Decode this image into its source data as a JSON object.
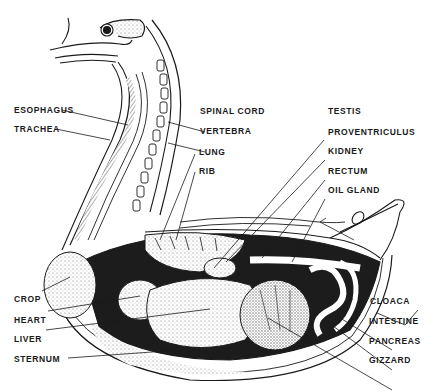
{
  "diagram": {
    "colors": {
      "ink": "#1a1a1a",
      "background": "#ffffff",
      "stipple": "#9a9a9a",
      "dark_fill": "#1c1c1c"
    },
    "labels": {
      "esophagus": "ESOPHAGUS",
      "trachea": "TRACHEA",
      "spinal_cord": "SPINAL CORD",
      "vertebra": "VERTEBRA",
      "lung": "LUNG",
      "rib": "RIB",
      "testis": "TESTIS",
      "proventriculus": "PROVENTRICULUS",
      "kidney": "KIDNEY",
      "rectum": "RECTUM",
      "oil_gland": "OIL GLAND",
      "crop": "CROP",
      "heart": "HEART",
      "liver": "LIVER",
      "sternum": "STERNUM",
      "cloaca": "CLOACA",
      "intestine": "INTESTINE",
      "pancreas": "PANCREAS",
      "gizzard": "GIZZARD"
    }
  }
}
